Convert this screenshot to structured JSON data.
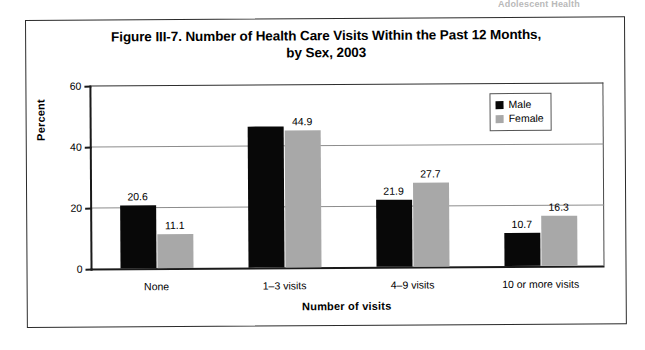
{
  "page": {
    "top_fragment": "Adolescent Health"
  },
  "figure": {
    "title_line1": "Figure III-7. Number of Health Care Visits Within the Past 12 Months,",
    "title_line2": "by Sex, 2003"
  },
  "legend": {
    "position": "top-right-inside",
    "entries": [
      {
        "label": "Male",
        "color": "#080808",
        "icon": "square-swatch"
      },
      {
        "label": "Female",
        "color": "#a8a8a8",
        "icon": "square-swatch"
      }
    ]
  },
  "chart_data": {
    "type": "bar",
    "title": "Figure III-7. Number of Health Care Visits Within the Past 12 Months, by Sex, 2003",
    "xlabel": "Number of visits",
    "ylabel": "Percent",
    "ylim": [
      0,
      60
    ],
    "yticks": [
      0,
      20,
      40,
      60
    ],
    "ytick_labels": [
      "0",
      "20",
      "40",
      "60"
    ],
    "grid": true,
    "grid_axis": "y",
    "legend_position": "upper right",
    "categories": [
      "None",
      "1–3 visits",
      "4–9 visits",
      "10 or more visits"
    ],
    "series": [
      {
        "name": "Male",
        "color": "#080808",
        "values": [
          20.6,
          46.3,
          21.9,
          10.7
        ],
        "data_labels": [
          "20.6",
          "",
          "21.9",
          "10.7"
        ]
      },
      {
        "name": "Female",
        "color": "#a8a8a8",
        "values": [
          11.1,
          44.9,
          27.7,
          16.3
        ],
        "data_labels": [
          "11.1",
          "44.9",
          "27.7",
          "16.3"
        ]
      }
    ]
  }
}
